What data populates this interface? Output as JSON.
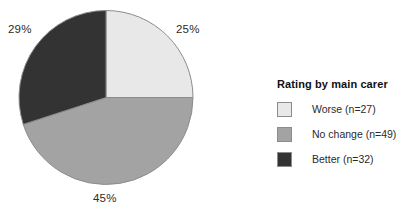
{
  "chart_data": {
    "type": "pie",
    "title": "Rating by main carer",
    "categories": [
      "Worse",
      "No change",
      "Better"
    ],
    "values": [
      25,
      45,
      29
    ],
    "counts": [
      27,
      49,
      32
    ],
    "value_unit": "%",
    "total_n": 108,
    "start_angle_deg": 0,
    "direction": "clockwise",
    "legend_position": "right",
    "grid": false,
    "xlabel": "",
    "ylabel": "",
    "slices": [
      {
        "name": "worse",
        "label": "Worse",
        "legend_label": "Worse (n=27)",
        "pct_label": "25%",
        "value": 25,
        "count": 27,
        "color": "#e8e8e8",
        "edge_color": "#8c8c8c",
        "start_deg": 0,
        "end_deg": 90
      },
      {
        "name": "no-change",
        "label": "No change",
        "legend_label": "No change (n=49)",
        "pct_label": "45%",
        "value": 45,
        "count": 49,
        "color": "#a3a3a3",
        "edge_color": "#8c8c8c",
        "start_deg": 90,
        "end_deg": 252
      },
      {
        "name": "better",
        "label": "Better",
        "legend_label": "Better (n=32)",
        "pct_label": "29%",
        "value": 29,
        "count": 32,
        "color": "#333333",
        "edge_color": "#8c8c8c",
        "start_deg": 252,
        "end_deg": 360
      }
    ]
  },
  "legend": {
    "title": "Rating by main carer",
    "items": [
      {
        "label": "Worse (n=27)",
        "color": "#e8e8e8"
      },
      {
        "label": "No change (n=49)",
        "color": "#a3a3a3"
      },
      {
        "label": "Better (n=32)",
        "color": "#333333"
      }
    ]
  },
  "labels": {
    "better_pct": "29%",
    "worse_pct": "25%",
    "nochange_pct": "45%"
  },
  "colors": {
    "background": "#ffffff",
    "worse": "#e8e8e8",
    "no_change": "#a3a3a3",
    "better": "#333333",
    "slice_outline": "#8c8c8c",
    "text": "#2b2b2b"
  }
}
